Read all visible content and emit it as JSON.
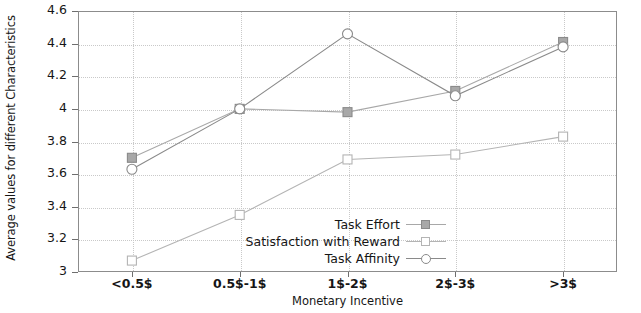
{
  "chart_data": {
    "type": "line",
    "title": "",
    "xlabel": "Monetary Incentive",
    "ylabel": "Average values for different Characteristics",
    "categories": [
      "<0.5$",
      "0.5$-1$",
      "1$-2$",
      "2$-3$",
      ">3$"
    ],
    "ytick_labels": [
      "4.6",
      "4.4",
      "4.2",
      "4",
      "3.8",
      "3.6",
      "3.4",
      "3.2",
      "3"
    ],
    "ytick_values": [
      4.6,
      4.4,
      4.2,
      4.0,
      3.8,
      3.6,
      3.4,
      3.2,
      3.0
    ],
    "ylim": [
      3.0,
      4.6
    ],
    "grid": true,
    "legend_position": "inside-bottom-center",
    "series": [
      {
        "name": "Task Effort",
        "marker": "filled-square",
        "color": "#a8a8a8",
        "values": [
          3.7,
          4.0,
          3.98,
          4.11,
          4.41
        ]
      },
      {
        "name": "Satisfaction with Reward",
        "marker": "open-square",
        "color": "#b4b4b4",
        "values": [
          3.07,
          3.35,
          3.69,
          3.72,
          3.83
        ]
      },
      {
        "name": "Task Affinity",
        "marker": "open-circle",
        "color": "#8a8a8a",
        "values": [
          3.63,
          4.0,
          4.46,
          4.08,
          4.38
        ]
      }
    ]
  },
  "legend": {
    "items": [
      {
        "label": "Task Effort"
      },
      {
        "label": "Satisfaction with Reward"
      },
      {
        "label": "Task Affinity"
      }
    ]
  },
  "axes": {
    "x_title": "Monetary Incentive",
    "y_title": "Average values for different Characteristics"
  }
}
